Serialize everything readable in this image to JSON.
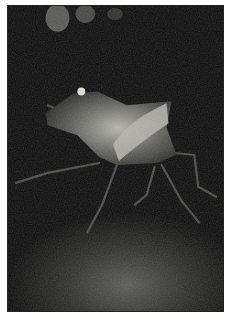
{
  "image": {
    "subject": "stink bug on rough surface",
    "alt": "Close-up photograph of a shield-shaped stink bug with speckled grey body and long legs on a dark textured surface",
    "colors": {
      "background": "#0b0b0b",
      "body": "#8a8a84",
      "highlight": "#d6d6cc",
      "surface": "#3a3a38",
      "border": "#ffffff"
    }
  }
}
